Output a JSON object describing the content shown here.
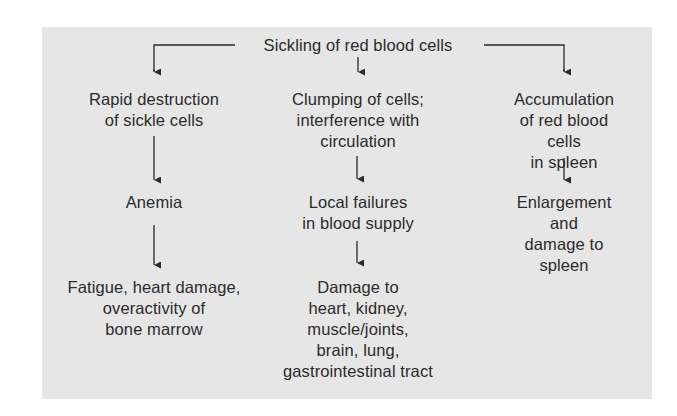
{
  "diagram": {
    "type": "flowchart",
    "colors": {
      "panel_background": "#e6e6e6",
      "page_background": "#ffffff",
      "text": "#2b2b2b",
      "lines": "#2b2b2b"
    },
    "root": {
      "label": "Sickling of red blood cells"
    },
    "columns": [
      {
        "nodes": [
          {
            "label": "Rapid destruction\nof sickle cells"
          },
          {
            "label": "Anemia"
          },
          {
            "label": "Fatigue, heart damage,\noveractivity of\nbone marrow"
          }
        ]
      },
      {
        "nodes": [
          {
            "label": "Clumping of cells;\ninterference with\ncirculation"
          },
          {
            "label": "Local failures\nin blood supply"
          },
          {
            "label": "Damage to\nheart, kidney,\nmuscle/joints,\nbrain, lung,\ngastrointestinal tract"
          }
        ]
      },
      {
        "nodes": [
          {
            "label": "Accumulation\nof red blood cells\nin spleen"
          },
          {
            "label": "Enlargement and\ndamage to spleen"
          }
        ]
      }
    ],
    "edges": [
      {
        "from": "Sickling of red blood cells",
        "to": "Rapid destruction of sickle cells"
      },
      {
        "from": "Sickling of red blood cells",
        "to": "Clumping of cells; interference with circulation"
      },
      {
        "from": "Sickling of red blood cells",
        "to": "Accumulation of red blood cells in spleen"
      },
      {
        "from": "Rapid destruction of sickle cells",
        "to": "Anemia"
      },
      {
        "from": "Anemia",
        "to": "Fatigue, heart damage, overactivity of bone marrow"
      },
      {
        "from": "Clumping of cells; interference with circulation",
        "to": "Local failures in blood supply"
      },
      {
        "from": "Local failures in blood supply",
        "to": "Damage to heart, kidney, muscle/joints, brain, lung, gastrointestinal tract"
      },
      {
        "from": "Accumulation of red blood cells in spleen",
        "to": "Enlargement and damage to spleen"
      }
    ]
  }
}
